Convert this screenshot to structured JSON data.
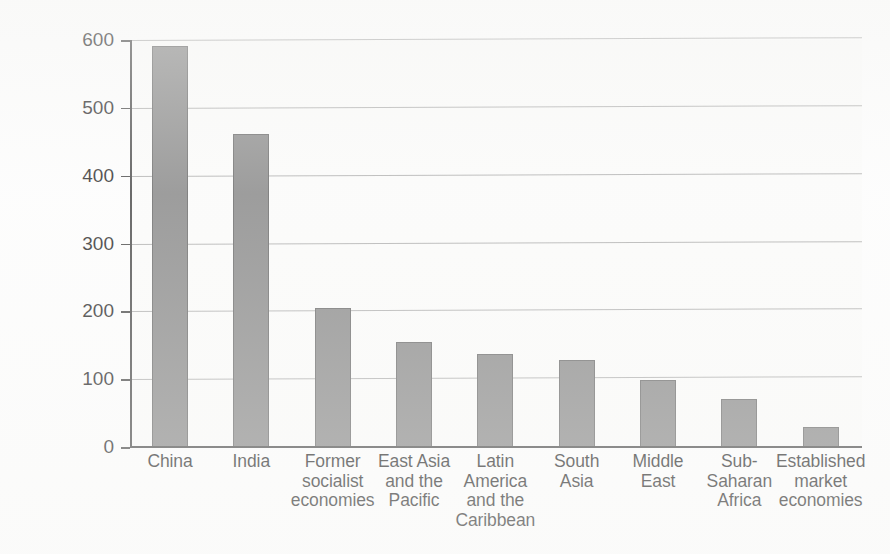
{
  "chart_data": {
    "type": "bar",
    "title": "",
    "subtitle": "",
    "xlabel": "",
    "ylabel": "Annual average deaths (thousands)",
    "ylim": [
      0,
      600
    ],
    "yticks": [
      0,
      100,
      200,
      300,
      400,
      500,
      600
    ],
    "ytick_labels": [
      "0",
      "100",
      "200",
      "300",
      "400",
      "500",
      "600"
    ],
    "grid": true,
    "grid_axis": "y",
    "legend": false,
    "legend_position": "none",
    "categories": [
      "China",
      "Former socialist economies",
      "East Asia and the Pacific",
      "Latin America and the Caribbean",
      "South Asia",
      "Middle East",
      "Sub-Saharan Africa",
      "Established market economies",
      "India"
    ],
    "category_lines": [
      [
        "China"
      ],
      [
        "India"
      ],
      [
        "Former",
        "socialist",
        "economies"
      ],
      [
        "East Asia",
        "and the",
        "Pacific"
      ],
      [
        "Latin",
        "America",
        "and the",
        "Caribbean"
      ],
      [
        "South",
        "Asia"
      ],
      [
        "Middle",
        "East"
      ],
      [
        "Sub-",
        "Saharan",
        "Africa"
      ],
      [
        "Established",
        "market",
        "economies"
      ]
    ],
    "series": [
      {
        "name": "Annual average deaths",
        "values": [
          591,
          461,
          205,
          155,
          137,
          128,
          99,
          71,
          30
        ]
      }
    ],
    "bar_color": "#7d7d7d",
    "bar_edge_color": "#5a5a5a",
    "grid_color": "#9b9b9b",
    "axis_color": "#3a3a3a",
    "plot_background": "#fbfbfa",
    "units": "thousands"
  }
}
